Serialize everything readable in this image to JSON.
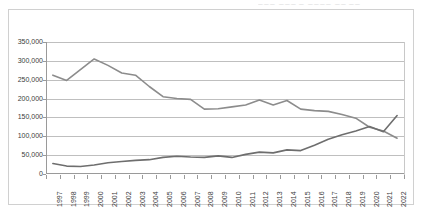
{
  "header": {
    "clipped_text": "▁▁▁ ▁▁▁ ▁ ▁▁▁▁      ▁▁      ▁▁"
  },
  "chart_data": {
    "type": "line",
    "title": "",
    "xlabel": "",
    "ylabel": "",
    "grid": true,
    "legend_position": "none",
    "ylim": [
      0,
      350000
    ],
    "ytick_values": [
      0,
      50000,
      100000,
      150000,
      200000,
      250000,
      300000,
      350000
    ],
    "ytick_labels": [
      "0",
      "50,000",
      "100,000",
      "150,000",
      "200,000",
      "250,000",
      "300,000",
      "350,000"
    ],
    "categories": [
      "1997",
      "1998",
      "1999",
      "2000",
      "2001",
      "2002",
      "2003",
      "2004",
      "2005",
      "2006",
      "2007",
      "2008",
      "2009",
      "2010",
      "2011",
      "2012",
      "2013",
      "2014",
      "2015",
      "2016",
      "2017",
      "2018",
      "2019",
      "2020",
      "2021",
      "2022"
    ],
    "series": [
      {
        "name": "series-upper",
        "color": "#8c8c8c",
        "values": [
          262000,
          248000,
          277000,
          305000,
          288000,
          268000,
          262000,
          232000,
          205000,
          200000,
          198000,
          172000,
          173000,
          178000,
          183000,
          196000,
          183000,
          195000,
          172000,
          168000,
          166000,
          158000,
          148000,
          124000,
          114000,
          95000
        ]
      },
      {
        "name": "series-lower",
        "color": "#6e6e6e",
        "values": [
          28000,
          21000,
          20000,
          24000,
          30000,
          33000,
          36000,
          38000,
          44000,
          47000,
          45000,
          44000,
          48000,
          44000,
          52000,
          58000,
          56000,
          64000,
          62000,
          76000,
          92000,
          104000,
          114000,
          126000,
          112000,
          155000
        ]
      }
    ]
  }
}
